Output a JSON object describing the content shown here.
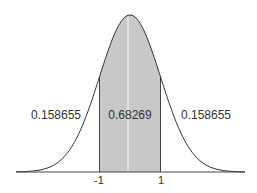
{
  "chart_data": {
    "type": "area",
    "title": "",
    "xlabel": "",
    "ylabel": "",
    "distribution": "standard normal",
    "mean": 0,
    "sd": 1,
    "xlim": [
      -3.75,
      3.75
    ],
    "shaded_interval": [
      -1,
      1
    ],
    "tick_labels": [
      "-1",
      "1"
    ],
    "tick_positions": [
      -1,
      1
    ],
    "regions": [
      {
        "name": "left-tail",
        "range": [
          "-inf",
          -1
        ],
        "label": "0.158655",
        "value": 0.158655
      },
      {
        "name": "center",
        "range": [
          -1,
          1
        ],
        "label": "0.68269",
        "value": 0.68269
      },
      {
        "name": "right-tail",
        "range": [
          1,
          "inf"
        ],
        "label": "0.158655",
        "value": 0.158655
      }
    ],
    "grid": false,
    "legend": "none"
  },
  "labels": {
    "left": "0.158655",
    "center": "0.68269",
    "right": "0.158655",
    "tick_minus1": "-1",
    "tick_plus1": "1"
  },
  "colors": {
    "shade": "#c8c8c8",
    "curve": "#333333",
    "axis": "#444444",
    "center_line": "#ffffff"
  }
}
